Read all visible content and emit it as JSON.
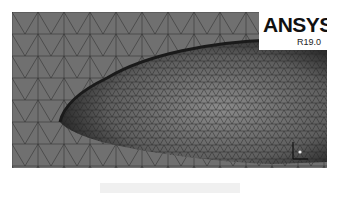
{
  "figure": {
    "colors": {
      "background_mesh": "#6e6e6e",
      "body": "#5a5a5a",
      "edges": "#2a2a2a"
    },
    "logo": {
      "title": "ANSYS",
      "version": "R19.0"
    },
    "axis_triad": {
      "visible": true
    }
  }
}
